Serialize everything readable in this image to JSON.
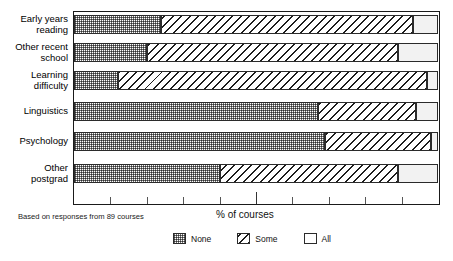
{
  "title_sliver": "",
  "note": "Based on responses from 89 courses",
  "legend_position": "bottom-center",
  "chart_data": {
    "type": "bar",
    "orientation": "horizontal",
    "stacked": true,
    "stacked_mode": "percent",
    "title": "",
    "xlabel": "% of courses",
    "ylabel": "",
    "xlim": [
      0,
      100
    ],
    "xticks": [
      0,
      10,
      20,
      30,
      40,
      50,
      60,
      70,
      80,
      90,
      100
    ],
    "xtick_labels": [
      "",
      "",
      "",
      "",
      "",
      "",
      "",
      "",
      "",
      "",
      ""
    ],
    "grid": false,
    "categories": [
      "Early years\nreading",
      "Other recent\nschool",
      "Learning\ndifficulty",
      "Linguistics",
      "Psychology",
      "Other\npostgrad"
    ],
    "series": [
      {
        "name": "None",
        "pattern": "stipple",
        "values": [
          24,
          20,
          12,
          67,
          69,
          40
        ]
      },
      {
        "name": "Some",
        "pattern": "diagonal-hatch",
        "values": [
          69,
          69,
          85,
          27,
          29,
          49
        ]
      },
      {
        "name": "All",
        "pattern": "blank",
        "values": [
          7,
          11,
          3,
          6,
          2,
          11
        ]
      }
    ],
    "annotations": [
      "Based on responses from 89 courses"
    ]
  }
}
